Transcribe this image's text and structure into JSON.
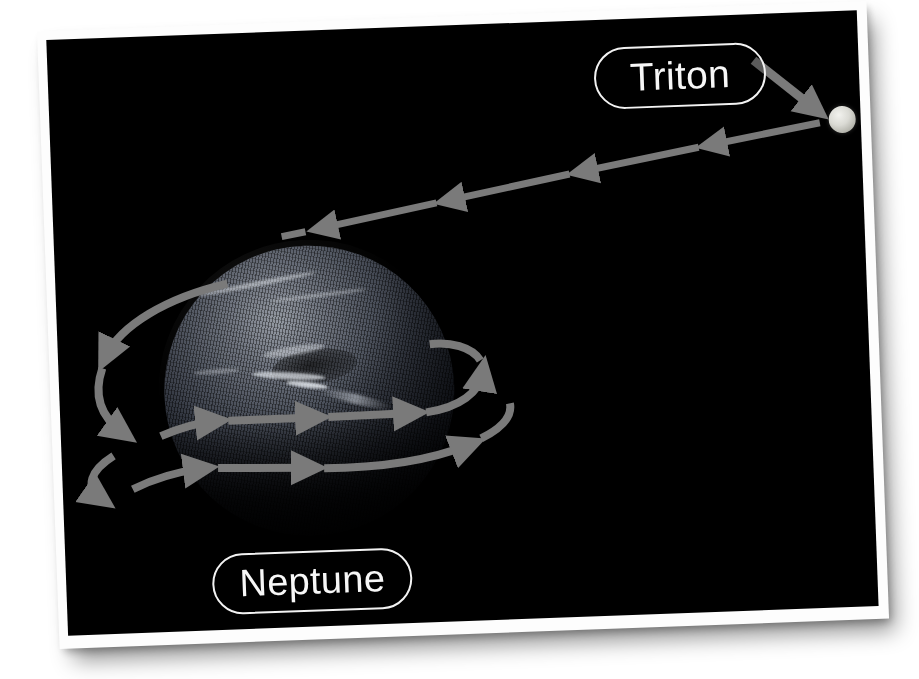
{
  "figure": {
    "background_color": "#ffffff",
    "photo_background_color": "#000000",
    "arrow_color": "#7a7a7a",
    "label_text_color": "#f7f7f7",
    "label_border_color": "#f2f2f2"
  },
  "labels": {
    "triton": "Triton",
    "neptune": "Neptune"
  },
  "bodies": [
    {
      "name": "Neptune",
      "type": "planet",
      "description": "large halftone-textured globe with bright cloud streaks and a dark spot",
      "color": "#6a7080"
    },
    {
      "name": "Triton",
      "type": "moon",
      "description": "small bright sphere at upper right",
      "color": "#dadad4"
    }
  ],
  "annotations": {
    "triton_pointer": {
      "name": "triton-label-pointer",
      "description": "thick arrow from the Triton label to the moon",
      "direction": "down-right"
    },
    "orbit_trail": {
      "name": "triton-orbit-trail",
      "description": "dashed diagonal track from Triton toward Neptune",
      "arrowhead_count": 4,
      "direction": "right-to-left"
    },
    "rotation_arrows": {
      "name": "neptune-rotation-arrows",
      "description": "two curved arrow bands encircling Neptune showing rotation",
      "count": 2,
      "direction": "west-to-east"
    }
  }
}
